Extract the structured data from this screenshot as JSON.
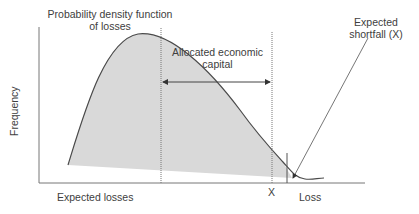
{
  "diagram": {
    "labels": {
      "pdf": "Probability density function",
      "pdf_line2": "of losses",
      "capital": "Allocated economic",
      "capital_line2": "capital",
      "shortfall": "Expected",
      "shortfall_line2": "shortfall (X)",
      "y_axis": "Frequency",
      "expected_losses": "Expected losses",
      "x_marker": "X",
      "x_axis": "Loss"
    },
    "colors": {
      "fill": "#d9d9d9",
      "line": "#4a4a4a",
      "text": "#404040"
    }
  }
}
